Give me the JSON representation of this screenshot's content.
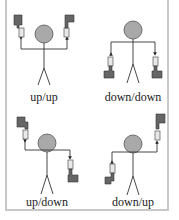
{
  "panels": [
    {
      "id": "up-up",
      "label": "up/up",
      "left": "up",
      "right": "up"
    },
    {
      "id": "down-down",
      "label": "down/down",
      "left": "down",
      "right": "down"
    },
    {
      "id": "up-down",
      "label": "up/down",
      "left": "up",
      "right": "down"
    },
    {
      "id": "down-up",
      "label": "down/up",
      "left": "down",
      "right": "up"
    }
  ],
  "colors": {
    "flag": "#666666",
    "head": "#a9a9a9",
    "line": "#333333",
    "border": "#c8c8c8",
    "handle": "#e8e8e8"
  }
}
